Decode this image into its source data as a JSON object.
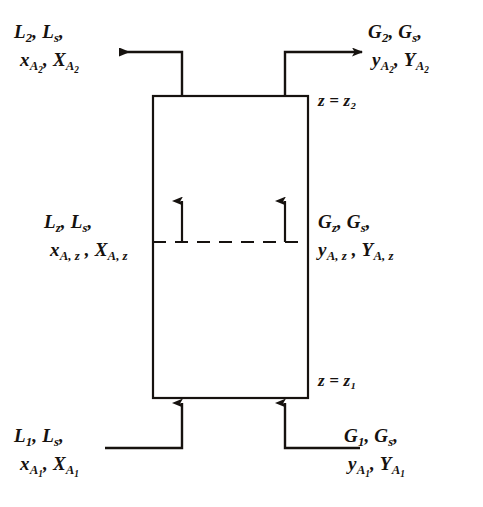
{
  "diagram": {
    "type": "process-flow-schematic",
    "stroke_color": "#16120f",
    "background_color": "#ffffff",
    "column": {
      "left": 153,
      "right": 308,
      "top": 96,
      "bottom": 398,
      "width": 155,
      "height": 302
    },
    "plane_markers": {
      "top": "z = z₂",
      "bottom": "z = z₁",
      "differential": "dashed-plane-at-z"
    },
    "streams": {
      "liquid_out_top": {
        "line1_flow": "L",
        "line1_flow_sub": "2",
        "line1_carrier": "L",
        "line1_carrier_sub": "s",
        "line2_mole_fraction": "x",
        "line2_mole_fraction_sub": "A",
        "line2_mole_fraction_sub2": "2",
        "line2_mole_ratio": "X",
        "line2_mole_ratio_sub": "A",
        "line2_mole_ratio_sub2": "2",
        "direction": "left",
        "phase": "liquid"
      },
      "gas_out_top": {
        "line1_flow": "G",
        "line1_flow_sub": "2",
        "line1_carrier": "G",
        "line1_carrier_sub": "s",
        "line2_mole_fraction": "y",
        "line2_mole_fraction_sub": "A",
        "line2_mole_fraction_sub2": "2",
        "line2_mole_ratio": "Y",
        "line2_mole_ratio_sub": "A",
        "line2_mole_ratio_sub2": "2",
        "direction": "right",
        "phase": "gas"
      },
      "liquid_at_z": {
        "line1_flow": "L",
        "line1_flow_sub": "z",
        "line1_carrier": "L",
        "line1_carrier_sub": "s",
        "line2_mole_fraction": "x",
        "line2_mole_fraction_sub": "A, z",
        "line2_mole_ratio": "X",
        "line2_mole_ratio_sub": "A, z",
        "phase": "liquid"
      },
      "gas_at_z": {
        "line1_flow": "G",
        "line1_flow_sub": "z",
        "line1_carrier": "G",
        "line1_carrier_sub": "s",
        "line2_mole_fraction": "y",
        "line2_mole_fraction_sub": "A, z",
        "line2_mole_ratio": "Y",
        "line2_mole_ratio_sub": "A, z",
        "phase": "gas"
      },
      "liquid_in_bottom": {
        "line1_flow": "L",
        "line1_flow_sub": "1",
        "line1_carrier": "L",
        "line1_carrier_sub": "s",
        "line2_mole_fraction": "x",
        "line2_mole_fraction_sub": "A",
        "line2_mole_fraction_sub2": "1",
        "line2_mole_ratio": "X",
        "line2_mole_ratio_sub": "A",
        "line2_mole_ratio_sub2": "1",
        "direction": "up",
        "phase": "liquid"
      },
      "gas_in_bottom": {
        "line1_flow": "G",
        "line1_flow_sub": "1",
        "line1_carrier": "G",
        "line1_carrier_sub": "s",
        "line2_mole_fraction": "y",
        "line2_mole_fraction_sub": "A",
        "line2_mole_fraction_sub2": "1",
        "line2_mole_ratio": "Y",
        "line2_mole_ratio_sub": "A",
        "line2_mole_ratio_sub2": "1",
        "direction": "up",
        "phase": "gas"
      }
    },
    "separators": {
      "comma": ",",
      "equals": "="
    }
  }
}
